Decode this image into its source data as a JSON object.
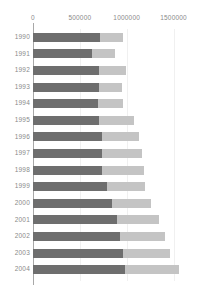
{
  "chart_data": {
    "type": "bar",
    "orientation": "horizontal",
    "stacked": true,
    "title": "",
    "subtitle": "",
    "xlabel": "",
    "ylabel": "",
    "xlim": [
      0,
      1750000
    ],
    "grid": true,
    "legend": "none",
    "xticks": [
      0,
      500000,
      1000000,
      1500000
    ],
    "xtick_labels": [
      "0",
      "500000",
      "1000000",
      "1500000"
    ],
    "categories": [
      "1990",
      "1991",
      "1992",
      "1993",
      "1994",
      "1995",
      "1996",
      "1997",
      "1998",
      "1999",
      "2000",
      "2001",
      "2002",
      "2003",
      "2004"
    ],
    "series": [
      {
        "name": "series-1",
        "color": "#6e6e6e",
        "values": [
          710000,
          630000,
          700000,
          700000,
          690000,
          700000,
          740000,
          740000,
          740000,
          790000,
          840000,
          900000,
          930000,
          960000,
          980000
        ]
      },
      {
        "name": "series-2",
        "color": "#c4c4c4",
        "values": [
          250000,
          250000,
          290000,
          250000,
          270000,
          380000,
          390000,
          420000,
          440000,
          410000,
          420000,
          440000,
          480000,
          500000,
          580000
        ]
      }
    ],
    "totals": [
      960000,
      880000,
      990000,
      950000,
      960000,
      1080000,
      1130000,
      1160000,
      1180000,
      1200000,
      1260000,
      1340000,
      1410000,
      1460000,
      1560000
    ]
  },
  "colors": {
    "series_1": "#6e6e6e",
    "series_2": "#c4c4c4",
    "axis": "#a8a8a8",
    "grid": "#f0f0f0",
    "text": "#8a8a8a",
    "background": "#ffffff"
  }
}
